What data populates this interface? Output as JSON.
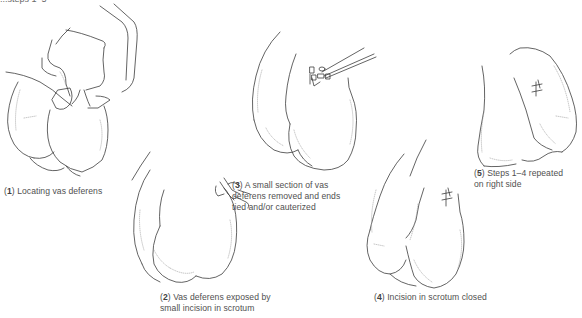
{
  "diagram": {
    "header_fragment": "...steps 1–5",
    "steps": [
      {
        "number": "1",
        "caption_lines": [
          "Locating vas deferens"
        ],
        "illustration": "hand-palpating-scrotum"
      },
      {
        "number": "2",
        "caption_lines": [
          "Vas deferens exposed by",
          "small incision in scrotum"
        ],
        "illustration": "clamp-on-scrotum-incision"
      },
      {
        "number": "3",
        "caption_lines": [
          "A small section of vas",
          "deferens removed and ends",
          "tied and/or cauterized"
        ],
        "illustration": "forceps-ligating-vas"
      },
      {
        "number": "4",
        "caption_lines": [
          "Incision in scrotum closed"
        ],
        "illustration": "sutured-incision-left"
      },
      {
        "number": "5",
        "caption_lines": [
          "Steps 1–4 repeated",
          "on right side"
        ],
        "illustration": "sutured-incision-right"
      }
    ]
  }
}
